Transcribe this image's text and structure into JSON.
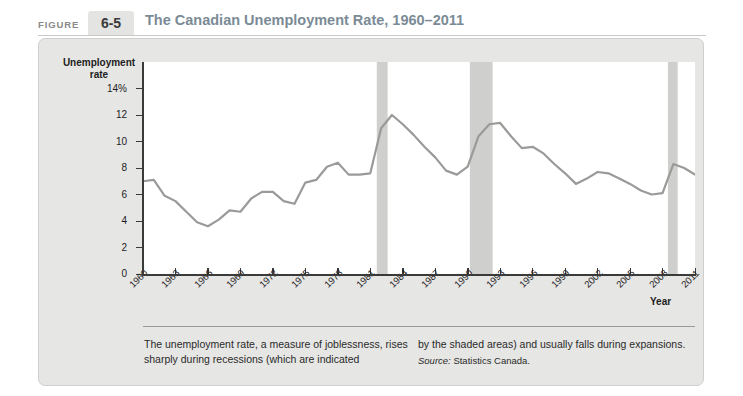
{
  "header": {
    "figure_label": "FIGURE",
    "figure_number": "6-5",
    "title": "The Canadian Unemployment Rate, 1960–2011"
  },
  "caption": {
    "left_text": "The unemployment rate, a measure of joblessness, rises sharply during recessions (which are indicated",
    "right_text": "by the shaded areas) and usually falls during expansions.",
    "source_word": "Source:",
    "source_text": " Statistics Canada."
  },
  "colors": {
    "line": "#9a9a98",
    "recession_band": "#cfcfcd",
    "plot_background": "#ffffff",
    "card_background": "#e6e6e4",
    "title_text": "#7b8b96",
    "figure_number_background": "#e4e4e2"
  },
  "chart_data": {
    "type": "line",
    "title": "The Canadian Unemployment Rate, 1960–2011",
    "xlabel": "Year",
    "ylabel": "Unemployment rate",
    "xlim": [
      1960,
      2011
    ],
    "ylim": [
      0,
      16
    ],
    "grid": false,
    "legend": null,
    "y_tick_values": [
      0,
      2,
      4,
      6,
      8,
      10,
      12,
      14
    ],
    "y_tick_labels": [
      "0",
      "2",
      "4",
      "6",
      "8",
      "10",
      "12",
      "14%"
    ],
    "x_tick_values": [
      1960,
      1963,
      1966,
      1969,
      1972,
      1975,
      1978,
      1981,
      1984,
      1987,
      1990,
      1993,
      1996,
      1999,
      2002,
      2005,
      2008,
      2011
    ],
    "x_tick_labels": [
      "1960",
      "1963",
      "1966",
      "1969",
      "1972",
      "1975",
      "1978",
      "1981",
      "1984",
      "1987",
      "1990",
      "1993",
      "1996",
      "1999",
      "2002",
      "2005",
      "2008",
      "2011"
    ],
    "x": [
      1960,
      1961,
      1962,
      1963,
      1964,
      1965,
      1966,
      1967,
      1968,
      1969,
      1970,
      1971,
      1972,
      1973,
      1974,
      1975,
      1976,
      1977,
      1978,
      1979,
      1980,
      1981,
      1982,
      1983,
      1984,
      1985,
      1986,
      1987,
      1988,
      1989,
      1990,
      1991,
      1992,
      1993,
      1994,
      1995,
      1996,
      1997,
      1998,
      1999,
      2000,
      2001,
      2002,
      2003,
      2004,
      2005,
      2006,
      2007,
      2008,
      2009,
      2010,
      2011
    ],
    "series": [
      {
        "name": "Unemployment rate",
        "units": "percent",
        "values": [
          7.0,
          7.1,
          5.9,
          5.5,
          4.7,
          3.9,
          3.6,
          4.1,
          4.8,
          4.7,
          5.7,
          6.2,
          6.2,
          5.5,
          5.3,
          6.9,
          7.1,
          8.1,
          8.4,
          7.5,
          7.5,
          7.6,
          11.0,
          12.0,
          11.3,
          10.5,
          9.6,
          8.8,
          7.8,
          7.5,
          8.1,
          10.4,
          11.3,
          11.4,
          10.4,
          9.5,
          9.6,
          9.1,
          8.3,
          7.6,
          6.8,
          7.2,
          7.7,
          7.6,
          7.2,
          6.8,
          6.3,
          6.0,
          6.1,
          8.3,
          8.0,
          7.5
        ]
      }
    ],
    "recession_bands": [
      {
        "start": 1981.6,
        "end": 1982.6
      },
      {
        "start": 1990.2,
        "end": 1992.3
      },
      {
        "start": 2008.5,
        "end": 2009.4
      }
    ]
  }
}
